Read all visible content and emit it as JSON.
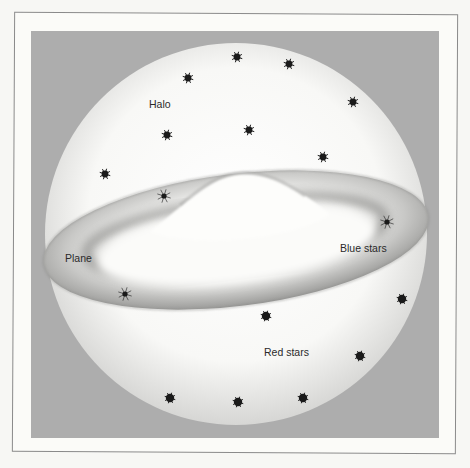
{
  "figure": {
    "labels": {
      "halo": "Halo",
      "plane": "Plane",
      "blue_stars": "Blue stars",
      "red_stars": "Red stars"
    },
    "colors": {
      "background": "#f7f7f4",
      "panel": "#adadad",
      "frame": "#8a8a8a",
      "star": "#1a1a1a"
    },
    "halo_stars": [
      [
        237,
        57
      ],
      [
        289,
        64
      ],
      [
        188,
        78
      ],
      [
        353,
        102
      ],
      [
        167,
        135
      ],
      [
        249,
        130
      ],
      [
        323,
        157
      ],
      [
        105,
        174
      ]
    ],
    "plane_stars": [
      [
        164,
        196
      ],
      [
        387,
        222
      ],
      [
        125,
        294
      ]
    ],
    "red_stars": [
      [
        266,
        316
      ],
      [
        402,
        299
      ],
      [
        360,
        356
      ],
      [
        170,
        398
      ],
      [
        238,
        402
      ],
      [
        303,
        398
      ]
    ]
  }
}
